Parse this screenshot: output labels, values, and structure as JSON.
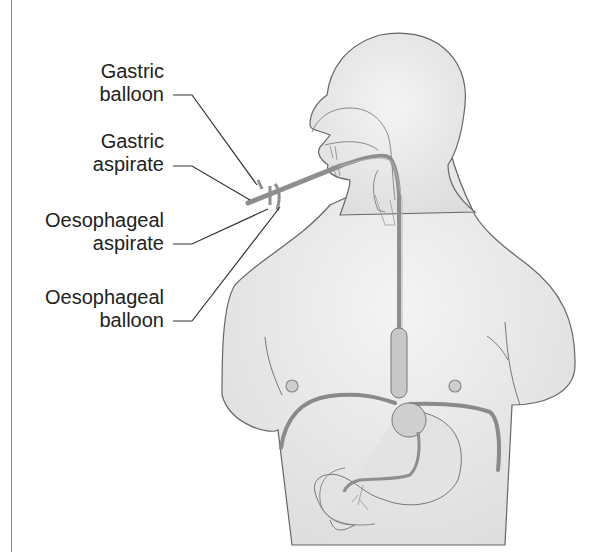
{
  "diagram": {
    "colors": {
      "body_fill": "#ececec",
      "outline": "#666666",
      "tube": "#9a9a9a",
      "leader_line": "#333333",
      "label_text": "#222222"
    },
    "labels": [
      {
        "id": "gastric-balloon",
        "line1": "Gastric",
        "line2": "balloon"
      },
      {
        "id": "gastric-aspirate",
        "line1": "Gastric",
        "line2": "aspirate"
      },
      {
        "id": "oesophageal-aspirate",
        "line1": "Oesophageal",
        "line2": "aspirate"
      },
      {
        "id": "oesophageal-balloon",
        "line1": "Oesophageal",
        "line2": "balloon"
      }
    ]
  }
}
